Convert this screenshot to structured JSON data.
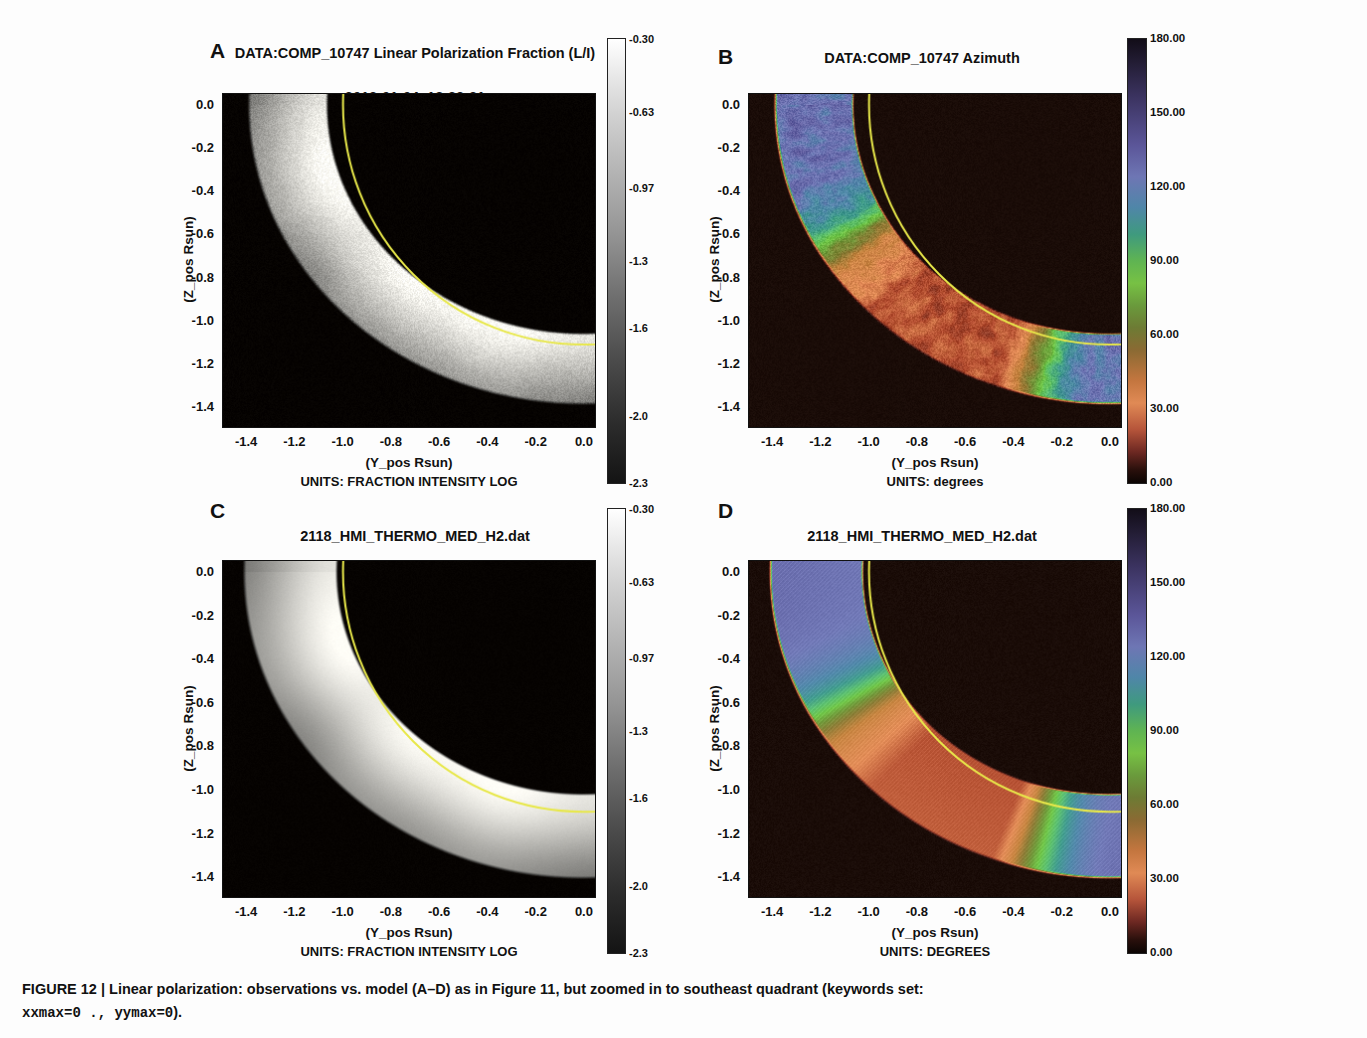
{
  "figure": {
    "caption_line1": "FIGURE 12 | Linear polarization: observations vs. model (A–D) as in Figure 11, but zoomed in to southeast quadrant (keywords set:",
    "caption_mono1": "xxmax=0 .",
    "caption_sep": ", ",
    "caption_mono2": "yymax=0",
    "caption_tail": ")."
  },
  "axes": {
    "xlabel": "(Y_pos Rsun)",
    "ylabel": "(Z_pos Rsun)",
    "xticks": [
      "-1.4",
      "-1.2",
      "-1.0",
      "-0.8",
      "-0.6",
      "-0.4",
      "-0.2",
      "0.0"
    ],
    "yticks": [
      "0.0",
      "-0.2",
      "-0.4",
      "-0.6",
      "-0.8",
      "-1.0",
      "-1.2",
      "-1.4"
    ],
    "xlim": [
      -1.5,
      0.05
    ],
    "ylim": [
      -1.5,
      0.05
    ]
  },
  "panels": [
    {
      "letter": "A",
      "title_lines": [
        "DATA:COMP_10747 Linear Polarization Fraction (L/I)",
        "2012-01-04_18:32:21",
        "B angle=-3.3400000 Central Meridian=68.072655"
      ],
      "units": "UNITS: FRACTION INTENSITY LOG",
      "colorbar": {
        "type": "grayscale",
        "ticks": [
          "-0.30",
          "-0.63",
          "-0.97",
          "-1.3",
          "-1.6",
          "-2.0",
          "-2.3"
        ],
        "min": -2.3,
        "max": -0.3
      },
      "limb_circle_color": "#e8e84a",
      "limb_radius_rsun": 1.0,
      "noisy": true
    },
    {
      "letter": "B",
      "title_lines": [
        "DATA:COMP_10747 Azimuth",
        "2012-01-04_18:32:21",
        "B angle=-3.3400000 Central Meridian=68.072655",
        "(ref. local vertical/radial)"
      ],
      "units": "UNITS: degrees",
      "colorbar": {
        "type": "rainbow",
        "ticks": [
          "180.00",
          "150.00",
          "120.00",
          "90.00",
          "60.00",
          "30.00",
          "0.00"
        ],
        "min": 0,
        "max": 180
      },
      "limb_circle_color": "#e8e84a",
      "limb_radius_rsun": 1.0,
      "noisy": true
    },
    {
      "letter": "C",
      "title_lines": [
        "2118_HMI_THERMO_MED_H2.dat",
        "10747_Stokes StokesLoI"
      ],
      "units": "UNITS: FRACTION INTENSITY LOG",
      "colorbar": {
        "type": "grayscale",
        "ticks": [
          "-0.30",
          "-0.63",
          "-0.97",
          "-1.3",
          "-1.6",
          "-2.0",
          "-2.3"
        ],
        "min": -2.3,
        "max": -0.3
      },
      "limb_circle_color": "#e8e84a",
      "limb_radius_rsun": 1.0,
      "noisy": false
    },
    {
      "letter": "D",
      "title_lines": [
        "2118_HMI_THERMO_MED_H2.dat",
        "10747_Stokes StokesAz",
        "(ref. local vertical/radial)"
      ],
      "units": "UNITS: DEGREES",
      "colorbar": {
        "type": "rainbow",
        "ticks": [
          "180.00",
          "150.00",
          "120.00",
          "90.00",
          "60.00",
          "30.00",
          "0.00"
        ],
        "min": 0,
        "max": 180
      },
      "limb_circle_color": "#e8e84a",
      "limb_radius_rsun": 1.0,
      "noisy": false
    }
  ],
  "chart_data": {
    "type": "heatmap",
    "xlabel": "(Y_pos Rsun)",
    "ylabel": "(Z_pos Rsun)",
    "xlim": [
      -1.5,
      0.05
    ],
    "ylim": [
      -1.5,
      0.05
    ],
    "grid": false,
    "legend": "colorbar-right",
    "annotations": [
      "yellow circle marks solar limb at r = 1.0 Rsun"
    ],
    "panels": [
      {
        "id": "A",
        "quantity": "Linear polarization fraction L/I (log)",
        "cmap": "grayscale",
        "zlim": [
          -2.3,
          -0.3
        ],
        "ztick_values": [
          -0.3,
          -0.63,
          -0.97,
          -1.3,
          -1.6,
          -2.0,
          -2.3
        ],
        "annulus_inner_rsun": 1.05,
        "annulus_outer_rsun": 1.38,
        "typical_annulus_value": -0.75,
        "background_value": -2.3,
        "source": "observation"
      },
      {
        "id": "B",
        "quantity": "Azimuth (ref. local vertical/radial)",
        "cmap": "rainbow",
        "zlim": [
          0,
          180
        ],
        "ztick_values": [
          0,
          30,
          60,
          90,
          120,
          150,
          180
        ],
        "annulus_inner_rsun": 1.05,
        "annulus_outer_rsun": 1.38,
        "dominant_values": [
          150,
          40
        ],
        "background_value": 0,
        "source": "observation"
      },
      {
        "id": "C",
        "quantity": "Linear polarization fraction L/I (log), model",
        "cmap": "grayscale",
        "zlim": [
          -2.3,
          -0.3
        ],
        "ztick_values": [
          -0.3,
          -0.63,
          -0.97,
          -1.3,
          -1.6,
          -2.0,
          -2.3
        ],
        "annulus_inner_rsun": 1.0,
        "annulus_outer_rsun": 1.42,
        "typical_annulus_value": -0.9,
        "background_value": -2.3,
        "source": "model"
      },
      {
        "id": "D",
        "quantity": "Azimuth (ref. local vertical/radial), model",
        "cmap": "rainbow",
        "zlim": [
          0,
          180
        ],
        "ztick_values": [
          0,
          30,
          60,
          90,
          120,
          150,
          180
        ],
        "annulus_inner_rsun": 1.0,
        "annulus_outer_rsun": 1.42,
        "dominant_values": [
          150,
          40
        ],
        "background_value": 0,
        "source": "model"
      }
    ]
  }
}
